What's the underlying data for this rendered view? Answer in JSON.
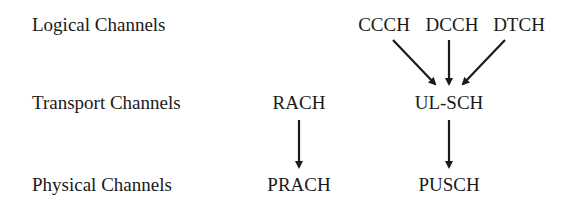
{
  "rows": {
    "logical": "Logical Channels",
    "transport": "Transport Channels",
    "physical": "Physical Channels"
  },
  "logical_channels": [
    "CCCH",
    "DCCH",
    "DTCH"
  ],
  "transport_channels": [
    "RACH",
    "UL-SCH"
  ],
  "physical_channels": [
    "PRACH",
    "PUSCH"
  ],
  "mappings": [
    {
      "from": "CCCH",
      "to": "UL-SCH"
    },
    {
      "from": "DCCH",
      "to": "UL-SCH"
    },
    {
      "from": "DTCH",
      "to": "UL-SCH"
    },
    {
      "from": "RACH",
      "to": "PRACH"
    },
    {
      "from": "UL-SCH",
      "to": "PUSCH"
    }
  ]
}
